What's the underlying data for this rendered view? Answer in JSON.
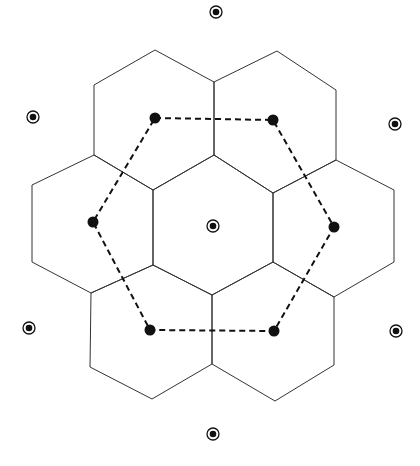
{
  "diagram": {
    "colors": {
      "line": "#333333",
      "dash": "#111111",
      "dot": "#111111",
      "background": "#ffffff"
    },
    "hex_cells": [
      {
        "id": "top-left",
        "points": "94,85 155,50 214,82 214,155 153,190 94,155"
      },
      {
        "id": "top-right",
        "points": "214,82 277,51 336,90 336,160 273,193 214,155"
      },
      {
        "id": "middle-left",
        "points": "32,185 94,155 153,190 153,265 91,293 32,262"
      },
      {
        "id": "center",
        "points": "153,190 214,155 273,193 273,262 212,295 153,265"
      },
      {
        "id": "middle-right",
        "points": "273,193 336,160 394,190 394,262 334,297 273,262"
      },
      {
        "id": "bottom-left",
        "points": "91,293 153,265 212,295 212,364 152,399 90,367"
      },
      {
        "id": "bottom-right",
        "points": "212,295 273,262 334,297 334,365 275,401 212,364"
      }
    ],
    "dashed_hexagon": {
      "points": "155,118 273,120 334,227 274,331 150,330 93,222"
    },
    "center_dots": [
      {
        "id": "dot-top-left",
        "cx": 155,
        "cy": 118
      },
      {
        "id": "dot-top-right",
        "cx": 273,
        "cy": 120
      },
      {
        "id": "dot-right",
        "cx": 334,
        "cy": 227
      },
      {
        "id": "dot-bottom-right",
        "cx": 274,
        "cy": 331
      },
      {
        "id": "dot-bottom-left",
        "cx": 150,
        "cy": 330
      },
      {
        "id": "dot-left",
        "cx": 93,
        "cy": 222
      }
    ],
    "targets": [
      {
        "id": "target-center",
        "cx": 213,
        "cy": 226
      },
      {
        "id": "target-top",
        "cx": 216,
        "cy": 12
      },
      {
        "id": "target-upper-left",
        "cx": 33,
        "cy": 117
      },
      {
        "id": "target-upper-right",
        "cx": 395,
        "cy": 124
      },
      {
        "id": "target-lower-left",
        "cx": 29,
        "cy": 328
      },
      {
        "id": "target-lower-right",
        "cx": 396,
        "cy": 331
      },
      {
        "id": "target-bottom",
        "cx": 213,
        "cy": 434
      }
    ]
  }
}
